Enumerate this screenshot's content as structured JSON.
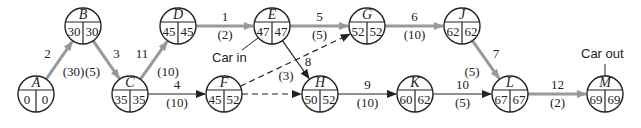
{
  "diagram": {
    "type": "activity-on-node network (critical path)",
    "colors": {
      "critical": "#999999",
      "normal": "#222222",
      "node_stroke": "#222222"
    },
    "nodes": [
      {
        "id": "A",
        "es": "0",
        "ls": "0",
        "x": 36,
        "y": 94
      },
      {
        "id": "B",
        "es": "30",
        "ls": "30",
        "x": 83,
        "y": 26
      },
      {
        "id": "C",
        "es": "35",
        "ls": "35",
        "x": 130,
        "y": 94
      },
      {
        "id": "D",
        "es": "45",
        "ls": "45",
        "x": 178,
        "y": 26
      },
      {
        "id": "E",
        "es": "47",
        "ls": "47",
        "x": 272,
        "y": 26
      },
      {
        "id": "F",
        "es": "45",
        "ls": "52",
        "x": 224,
        "y": 94
      },
      {
        "id": "G",
        "es": "52",
        "ls": "52",
        "x": 367,
        "y": 26
      },
      {
        "id": "H",
        "es": "50",
        "ls": "52",
        "x": 320,
        "y": 94
      },
      {
        "id": "J",
        "es": "62",
        "ls": "62",
        "x": 462,
        "y": 26
      },
      {
        "id": "K",
        "es": "60",
        "ls": "62",
        "x": 415,
        "y": 94
      },
      {
        "id": "L",
        "es": "67",
        "ls": "67",
        "x": 510,
        "y": 94
      },
      {
        "id": "M",
        "es": "69",
        "ls": "69",
        "x": 605,
        "y": 94
      }
    ],
    "edges": [
      {
        "from": "A",
        "to": "B",
        "activity": "2",
        "duration": "(30)",
        "critical": true
      },
      {
        "from": "B",
        "to": "C",
        "activity": "3",
        "duration": "(5)",
        "critical": true
      },
      {
        "from": "C",
        "to": "D",
        "activity": "11",
        "duration": "(10)",
        "critical": true
      },
      {
        "from": "C",
        "to": "F",
        "activity": "4",
        "duration": "(10)",
        "critical": false
      },
      {
        "from": "D",
        "to": "E",
        "activity": "1",
        "duration": "(2)",
        "critical": true
      },
      {
        "from": "E",
        "to": "G",
        "activity": "5",
        "duration": "(5)",
        "critical": true
      },
      {
        "from": "E",
        "to": "H",
        "activity": "8",
        "duration": "(3)",
        "critical": false
      },
      {
        "from": "F",
        "to": "G",
        "activity": "",
        "duration": "",
        "critical": false,
        "dummy": true
      },
      {
        "from": "F",
        "to": "H",
        "activity": "",
        "duration": "",
        "critical": false,
        "dummy": true
      },
      {
        "from": "G",
        "to": "J",
        "activity": "6",
        "duration": "(10)",
        "critical": true
      },
      {
        "from": "H",
        "to": "K",
        "activity": "9",
        "duration": "(10)",
        "critical": false
      },
      {
        "from": "J",
        "to": "L",
        "activity": "7",
        "duration": "(5)",
        "critical": true
      },
      {
        "from": "K",
        "to": "L",
        "activity": "10",
        "duration": "(5)",
        "critical": false
      },
      {
        "from": "L",
        "to": "M",
        "activity": "12",
        "duration": "(2)",
        "critical": true
      }
    ],
    "annotations": {
      "car_in": "Car in",
      "car_out": "Car out"
    }
  }
}
